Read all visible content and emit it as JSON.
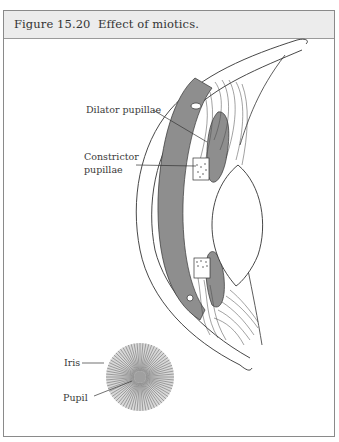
{
  "figure": {
    "title": "Figure 15.20  Effect of miotics."
  },
  "labels": {
    "dilator": "Dilator pupillae",
    "constrictor_line1": "Constrictor",
    "constrictor_line2": "pupillae",
    "iris": "Iris",
    "pupil": "Pupil"
  },
  "colors": {
    "header_bg": "#ececec",
    "iris_gray": "#8e8e8e",
    "line": "#333333",
    "frame": "#8a8a8a"
  }
}
